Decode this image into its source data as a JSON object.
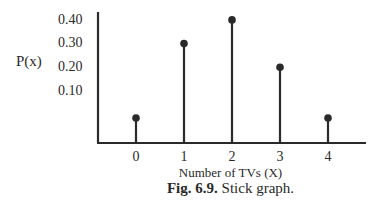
{
  "chart_data": {
    "type": "bar",
    "subtype": "stick",
    "title": "",
    "xlabel": "Number of TVs (X)",
    "ylabel": "P(x)",
    "categories": [
      "0",
      "1",
      "2",
      "3",
      "4"
    ],
    "x": [
      0,
      1,
      2,
      3,
      4
    ],
    "values": [
      0.05,
      0.3,
      0.4,
      0.2,
      0.05
    ],
    "yticks": [
      "0.10",
      "0.20",
      "0.30",
      "0.40"
    ],
    "ylim": [
      0,
      0.45
    ],
    "grid": false,
    "legend": null,
    "caption_prefix": "Fig. 6.9.",
    "caption_text": " Stick graph."
  },
  "colors": {
    "ink": "#2a2a2a",
    "background": "#ffffff"
  }
}
